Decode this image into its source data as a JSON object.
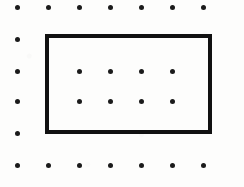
{
  "figure": {
    "canvas": {
      "width": 244,
      "height": 187,
      "background": "#fdfdfc"
    }
  },
  "grid": {
    "name": "dot-lattice",
    "columns": 7,
    "rows": 6,
    "column_x": [
      17,
      48,
      79,
      110,
      141,
      172,
      203
    ],
    "row_y": [
      7,
      39,
      71,
      101,
      133,
      165
    ],
    "dot_diameter": 5,
    "dot_color": "#1b1b1b",
    "visible_dots": [
      {
        "col": 0,
        "row": 0,
        "x": 17,
        "y": 7,
        "visible": true
      },
      {
        "col": 1,
        "row": 0,
        "x": 48,
        "y": 7,
        "visible": true
      },
      {
        "col": 2,
        "row": 0,
        "x": 79,
        "y": 7,
        "visible": true
      },
      {
        "col": 3,
        "row": 0,
        "x": 110,
        "y": 7,
        "visible": true
      },
      {
        "col": 4,
        "row": 0,
        "x": 141,
        "y": 7,
        "visible": true
      },
      {
        "col": 5,
        "row": 0,
        "x": 172,
        "y": 7,
        "visible": true
      },
      {
        "col": 6,
        "row": 0,
        "x": 203,
        "y": 7,
        "visible": true
      },
      {
        "col": 0,
        "row": 1,
        "x": 17,
        "y": 39,
        "visible": true
      },
      {
        "col": 1,
        "row": 1,
        "x": 48,
        "y": 39,
        "visible": false
      },
      {
        "col": 2,
        "row": 1,
        "x": 79,
        "y": 39,
        "visible": false
      },
      {
        "col": 3,
        "row": 1,
        "x": 110,
        "y": 39,
        "visible": false
      },
      {
        "col": 4,
        "row": 1,
        "x": 141,
        "y": 39,
        "visible": false
      },
      {
        "col": 5,
        "row": 1,
        "x": 172,
        "y": 39,
        "visible": false
      },
      {
        "col": 6,
        "row": 1,
        "x": 203,
        "y": 39,
        "visible": false
      },
      {
        "col": 0,
        "row": 2,
        "x": 17,
        "y": 71,
        "visible": true
      },
      {
        "col": 1,
        "row": 2,
        "x": 48,
        "y": 71,
        "visible": false
      },
      {
        "col": 2,
        "row": 2,
        "x": 79,
        "y": 71,
        "visible": true
      },
      {
        "col": 3,
        "row": 2,
        "x": 110,
        "y": 71,
        "visible": true
      },
      {
        "col": 4,
        "row": 2,
        "x": 141,
        "y": 71,
        "visible": true
      },
      {
        "col": 5,
        "row": 2,
        "x": 172,
        "y": 71,
        "visible": true
      },
      {
        "col": 6,
        "row": 2,
        "x": 203,
        "y": 71,
        "visible": false
      },
      {
        "col": 0,
        "row": 3,
        "x": 17,
        "y": 101,
        "visible": true
      },
      {
        "col": 1,
        "row": 3,
        "x": 48,
        "y": 101,
        "visible": false
      },
      {
        "col": 2,
        "row": 3,
        "x": 79,
        "y": 101,
        "visible": true
      },
      {
        "col": 3,
        "row": 3,
        "x": 110,
        "y": 101,
        "visible": true
      },
      {
        "col": 4,
        "row": 3,
        "x": 141,
        "y": 101,
        "visible": true
      },
      {
        "col": 5,
        "row": 3,
        "x": 172,
        "y": 101,
        "visible": true
      },
      {
        "col": 6,
        "row": 3,
        "x": 203,
        "y": 101,
        "visible": false
      },
      {
        "col": 0,
        "row": 4,
        "x": 17,
        "y": 133,
        "visible": true
      },
      {
        "col": 1,
        "row": 4,
        "x": 48,
        "y": 133,
        "visible": false
      },
      {
        "col": 2,
        "row": 4,
        "x": 79,
        "y": 133,
        "visible": false
      },
      {
        "col": 3,
        "row": 4,
        "x": 110,
        "y": 133,
        "visible": false
      },
      {
        "col": 4,
        "row": 4,
        "x": 141,
        "y": 133,
        "visible": false
      },
      {
        "col": 5,
        "row": 4,
        "x": 172,
        "y": 133,
        "visible": false
      },
      {
        "col": 6,
        "row": 4,
        "x": 203,
        "y": 133,
        "visible": false
      },
      {
        "col": 0,
        "row": 5,
        "x": 17,
        "y": 165,
        "visible": true
      },
      {
        "col": 1,
        "row": 5,
        "x": 48,
        "y": 165,
        "visible": true
      },
      {
        "col": 2,
        "row": 5,
        "x": 79,
        "y": 165,
        "visible": true
      },
      {
        "col": 3,
        "row": 5,
        "x": 110,
        "y": 165,
        "visible": true
      },
      {
        "col": 4,
        "row": 5,
        "x": 141,
        "y": 165,
        "visible": true
      },
      {
        "col": 5,
        "row": 5,
        "x": 172,
        "y": 165,
        "visible": true
      },
      {
        "col": 6,
        "row": 5,
        "x": 203,
        "y": 165,
        "visible": true
      }
    ]
  },
  "rectangle": {
    "name": "rectangle-shape",
    "left": 45,
    "top": 34,
    "width": 167,
    "height": 100,
    "stroke_width": 4,
    "stroke_color": "#111111",
    "fill": "none",
    "corner_columns": [
      1,
      6
    ],
    "corner_rows": [
      1,
      4
    ]
  }
}
